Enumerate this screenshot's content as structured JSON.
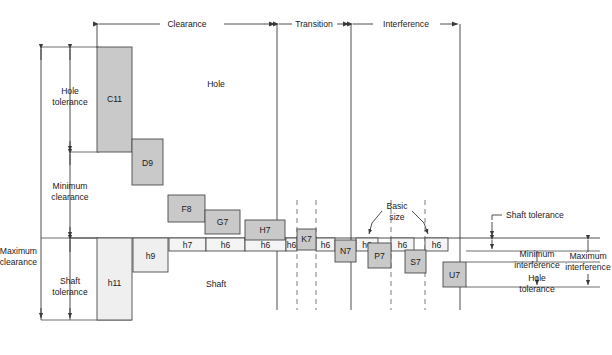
{
  "diagram": {
    "type": "engineering-tolerance-diagram",
    "colors": {
      "hole_box_fill": "#c9c9c9",
      "shaft_box_fill": "#efefef",
      "h_box_fill": "#f4f4f4",
      "line": "#3a3a3a",
      "dashed_line": "#5a5a5a",
      "text": "#1a1a1a",
      "background": "#ffffff"
    },
    "top_spans": [
      {
        "label": "Clearance",
        "x1": 97,
        "x2": 277
      },
      {
        "label": "Transition",
        "x1": 277,
        "x2": 351
      },
      {
        "label": "Interference",
        "x1": 351,
        "x2": 460
      }
    ],
    "region_labels": [
      {
        "name": "hole-region-label",
        "text": "Hole",
        "x": 216,
        "y": 84
      },
      {
        "name": "shaft-region-label",
        "text": "Shaft",
        "x": 216,
        "y": 284
      }
    ],
    "left_dimensions": [
      {
        "name": "hole-tolerance",
        "line1": "Hole",
        "line2": "tolerance",
        "x": 70,
        "y1": 47,
        "y2": 152
      },
      {
        "name": "minimum-clearance",
        "line1": "Minimum",
        "line2": "clearance",
        "x": 70,
        "y1": 152,
        "y2": 238
      },
      {
        "name": "maximum-clearance",
        "line1": "Maximum",
        "line2": "clearance",
        "x": 41,
        "y1": 47,
        "y2": 320
      },
      {
        "name": "shaft-tolerance-left",
        "line1": "Shaft",
        "line2": "tolerance",
        "x": 70,
        "y1": 238,
        "y2": 320
      }
    ],
    "right_dimensions": [
      {
        "name": "shaft-tolerance-right",
        "line1": "Shaft tolerance",
        "line2": ""
      },
      {
        "name": "minimum-interference",
        "line1": "Minimum",
        "line2": "interference"
      },
      {
        "name": "hole-tolerance-right",
        "line1": "Hole",
        "line2": "tolerance"
      },
      {
        "name": "maximum-interference",
        "line1": "Maximum",
        "line2": "interference"
      }
    ],
    "basic_size_callout": {
      "line1": "Basic",
      "line2": "size",
      "x": 397,
      "y": 206
    },
    "hole_boxes": [
      {
        "label": "C11",
        "x": 97,
        "y": 47,
        "w": 35,
        "h": 105,
        "shade": "dark"
      },
      {
        "label": "D9",
        "x": 132,
        "y": 139,
        "w": 31,
        "h": 46,
        "shade": "dark"
      },
      {
        "label": "F8",
        "x": 168,
        "y": 195,
        "w": 37,
        "h": 27,
        "shade": "dark"
      },
      {
        "label": "G7",
        "x": 205,
        "y": 210,
        "w": 35,
        "h": 24,
        "shade": "dark"
      },
      {
        "label": "H7",
        "x": 245,
        "y": 220,
        "w": 40,
        "h": 20,
        "shade": "dark"
      },
      {
        "label": "K7",
        "x": 297,
        "y": 229,
        "w": 19,
        "h": 21,
        "shade": "dark"
      },
      {
        "label": "N7",
        "x": 335,
        "y": 240,
        "w": 21,
        "h": 22,
        "shade": "dark"
      },
      {
        "label": "P7",
        "x": 368,
        "y": 243,
        "w": 23,
        "h": 25,
        "shade": "dark"
      },
      {
        "label": "S7",
        "x": 405,
        "y": 250,
        "w": 21,
        "h": 23,
        "shade": "dark"
      },
      {
        "label": "U7",
        "x": 443,
        "y": 262,
        "w": 23,
        "h": 25,
        "shade": "dark"
      }
    ],
    "shaft_boxes": [
      {
        "label": "h11",
        "x": 97,
        "y": 238,
        "w": 35,
        "h": 82
      },
      {
        "label": "h9",
        "x": 133,
        "y": 238,
        "w": 35,
        "h": 34
      },
      {
        "label": "h7",
        "x": 169,
        "y": 238,
        "w": 37,
        "h": 13
      },
      {
        "label": "h6",
        "x": 206,
        "y": 238,
        "w": 39,
        "h": 13
      },
      {
        "label": "h6",
        "x": 245,
        "y": 238,
        "w": 41,
        "h": 13
      },
      {
        "label": "h6",
        "x": 286,
        "y": 238,
        "w": 11,
        "h": 13
      },
      {
        "label": "h6",
        "x": 316,
        "y": 238,
        "w": 19,
        "h": 13
      },
      {
        "label": "h6",
        "x": 356,
        "y": 238,
        "w": 22,
        "h": 13
      },
      {
        "label": "h6",
        "x": 391,
        "y": 238,
        "w": 23,
        "h": 13
      },
      {
        "label": "h6",
        "x": 425,
        "y": 238,
        "w": 23,
        "h": 13
      }
    ],
    "vertical_dividers": [
      {
        "name": "divider-clearance-transition",
        "x": 277,
        "y1": 24,
        "y2": 310,
        "style": "solid"
      },
      {
        "name": "divider-transition-k7",
        "x": 297,
        "y1": 200,
        "y2": 310,
        "style": "dashed"
      },
      {
        "name": "divider-transition-n7",
        "x": 316,
        "y1": 200,
        "y2": 310,
        "style": "dashed"
      },
      {
        "name": "divider-transition-end",
        "x": 351,
        "y1": 24,
        "y2": 310,
        "style": "solid"
      },
      {
        "name": "divider-p7",
        "x": 391,
        "y1": 200,
        "y2": 310,
        "style": "dashed"
      },
      {
        "name": "divider-s7",
        "x": 425,
        "y1": 200,
        "y2": 310,
        "style": "dashed"
      },
      {
        "name": "divider-interference-end",
        "x": 460,
        "y1": 24,
        "y2": 310,
        "style": "solid"
      }
    ],
    "basic_size_line": {
      "y": 238,
      "x1": 70,
      "x2": 600
    }
  }
}
